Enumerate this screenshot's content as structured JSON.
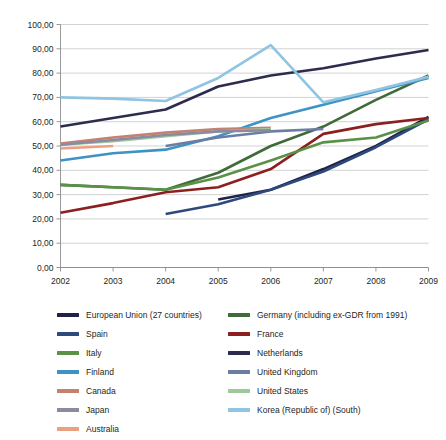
{
  "chart_data": {
    "type": "line",
    "title": "",
    "subtitle": "",
    "xlabel": "",
    "ylabel": "",
    "x": [
      2002,
      2003,
      2004,
      2005,
      2006,
      2007,
      2008,
      2009
    ],
    "xtick_labels": [
      "2002",
      "2003",
      "2004",
      "2005",
      "2006",
      "2007",
      "2008",
      "2009"
    ],
    "ytick_labels": [
      "0,00",
      "10,00",
      "20,00",
      "30,00",
      "40,00",
      "50,00",
      "60,00",
      "70,00",
      "80,00",
      "90,00",
      "100,00"
    ],
    "ytick_values": [
      0,
      10,
      20,
      30,
      40,
      50,
      60,
      70,
      80,
      90,
      100
    ],
    "ylim": [
      0,
      100
    ],
    "xlim": [
      2002,
      2009
    ],
    "grid": "horizontal",
    "legend_position": "bottom",
    "legend_columns": 2,
    "series": [
      {
        "name": "European Union (27 countries)",
        "color": "#1f2246",
        "x": [
          2005,
          2006,
          2007,
          2008,
          2009
        ],
        "values": [
          28.0,
          32.0,
          40.5,
          50.0,
          62.0
        ]
      },
      {
        "name": "Germany (including ex-GDR from 1991)",
        "color": "#3e6b38",
        "x": [
          2002,
          2003,
          2004,
          2005,
          2006,
          2007,
          2008,
          2009
        ],
        "values": [
          34.0,
          33.0,
          32.0,
          39.0,
          50.0,
          58.0,
          69.0,
          79.0
        ]
      },
      {
        "name": "Spain",
        "color": "#2e4a7d",
        "x": [
          2004,
          2005,
          2006,
          2007,
          2008,
          2009
        ],
        "values": [
          22.0,
          26.0,
          32.0,
          39.5,
          49.5,
          61.0
        ]
      },
      {
        "name": "France",
        "color": "#8c2020",
        "x": [
          2002,
          2003,
          2004,
          2005,
          2006,
          2007,
          2008,
          2009
        ],
        "values": [
          22.5,
          26.5,
          31.0,
          33.0,
          40.5,
          55.0,
          59.0,
          61.5
        ]
      },
      {
        "name": "Italy",
        "color": "#5a9146",
        "x": [
          2002,
          2003,
          2004,
          2005,
          2006,
          2007,
          2008,
          2009
        ],
        "values": [
          34.0,
          33.0,
          32.0,
          37.0,
          44.0,
          51.5,
          53.5,
          60.5
        ]
      },
      {
        "name": "Netherlands",
        "color": "#2b2c4e",
        "x": [
          2002,
          2003,
          2004,
          2005,
          2006,
          2007,
          2008,
          2009
        ],
        "values": [
          58.0,
          61.5,
          65.0,
          74.5,
          79.0,
          82.0,
          86.0,
          89.5
        ]
      },
      {
        "name": "Finland",
        "color": "#3d93c4",
        "x": [
          2002,
          2003,
          2004,
          2005,
          2006,
          2007,
          2008,
          2009
        ],
        "values": [
          44.0,
          47.0,
          48.5,
          54.0,
          61.5,
          67.0,
          72.5,
          78.0
        ]
      },
      {
        "name": "United Kingdom",
        "color": "#6a7da3",
        "x": [
          2004,
          2005,
          2006,
          2007
        ],
        "values": [
          50.0,
          53.5,
          56.0,
          57.0
        ]
      },
      {
        "name": "Canada",
        "color": "#c48070",
        "x": [
          2002,
          2003,
          2004,
          2005,
          2006
        ],
        "values": [
          51.0,
          53.5,
          55.5,
          57.0,
          57.5
        ]
      },
      {
        "name": "United States",
        "color": "#9ec79a",
        "x": [
          2002,
          2003,
          2004,
          2005,
          2006
        ],
        "values": [
          50.5,
          52.0,
          54.0,
          56.0,
          57.0
        ]
      },
      {
        "name": "Japan",
        "color": "#8b8a9e",
        "x": [
          2002,
          2003,
          2004,
          2005,
          2006
        ],
        "values": [
          50.5,
          52.5,
          54.5,
          56.0,
          56.5
        ]
      },
      {
        "name": "Korea (Republic of) (South)",
        "color": "#8fc4e2",
        "x": [
          2002,
          2003,
          2004,
          2005,
          2006,
          2007,
          2008,
          2009
        ],
        "values": [
          70.0,
          69.5,
          68.5,
          78.0,
          91.5,
          68.0,
          73.0,
          78.5
        ]
      },
      {
        "name": "Australia",
        "color": "#eaa183",
        "x": [
          2002,
          2003
        ],
        "values": [
          49.0,
          50.0
        ]
      }
    ]
  },
  "legend": {
    "left_column": [
      {
        "label": "European Union (27 countries)",
        "color": "#1f2246"
      },
      {
        "label": "Spain",
        "color": "#2e4a7d"
      },
      {
        "label": "Italy",
        "color": "#5a9146"
      },
      {
        "label": "Finland",
        "color": "#3d93c4"
      },
      {
        "label": "Canada",
        "color": "#c48070"
      },
      {
        "label": "Japan",
        "color": "#8b8a9e"
      },
      {
        "label": "Australia",
        "color": "#eaa183"
      }
    ],
    "right_column": [
      {
        "label": "Germany (including ex-GDR from 1991)",
        "color": "#3e6b38"
      },
      {
        "label": "France",
        "color": "#8c2020"
      },
      {
        "label": "Netherlands",
        "color": "#2b2c4e"
      },
      {
        "label": "United Kingdom",
        "color": "#6a7da3"
      },
      {
        "label": "United States",
        "color": "#9ec79a"
      },
      {
        "label": "Korea (Republic of) (South)",
        "color": "#8fc4e2"
      }
    ]
  }
}
